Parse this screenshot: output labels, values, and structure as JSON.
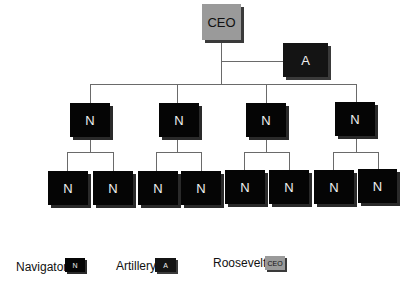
{
  "diagram": {
    "type": "org-chart",
    "root": {
      "label": "CEO",
      "role": "Roosevelt",
      "color": "#9a9a9a"
    },
    "staff": {
      "label": "A",
      "role": "Artillery",
      "color": "#141414"
    },
    "level1": [
      {
        "label": "N",
        "role": "Navigator",
        "children": [
          {
            "label": "N"
          },
          {
            "label": "N"
          }
        ]
      },
      {
        "label": "N",
        "role": "Navigator",
        "children": [
          {
            "label": "N"
          },
          {
            "label": "N"
          }
        ]
      },
      {
        "label": "N",
        "role": "Navigator",
        "children": [
          {
            "label": "N"
          },
          {
            "label": "N"
          }
        ]
      },
      {
        "label": "N",
        "role": "Navigator",
        "children": [
          {
            "label": "N"
          },
          {
            "label": "N"
          }
        ]
      }
    ]
  },
  "legend": [
    {
      "name": "Navigator",
      "symbol": "N",
      "color": "#050505"
    },
    {
      "name": "Artillery",
      "symbol": "A",
      "color": "#141414"
    },
    {
      "name": "Roosevelt",
      "symbol": "CEO",
      "color": "#9a9a9a"
    }
  ]
}
